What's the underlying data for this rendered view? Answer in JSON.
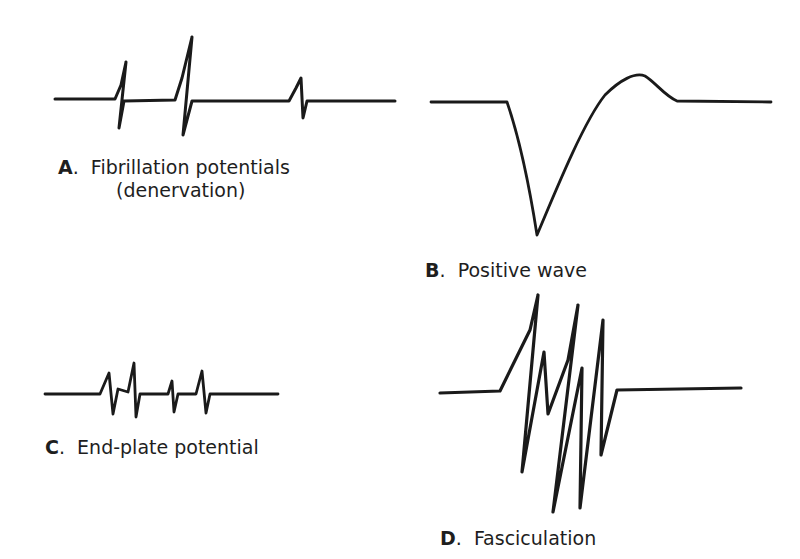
{
  "panels": [
    {
      "id": "A",
      "letter": "A",
      "title": "Fibrillation potentials",
      "subtitle": "(denervation)"
    },
    {
      "id": "B",
      "letter": "B",
      "title": "Positive wave"
    },
    {
      "id": "C",
      "letter": "C",
      "title": "End-plate potential"
    },
    {
      "id": "D",
      "letter": "D",
      "title": "Fasciculation"
    }
  ],
  "separator": ".",
  "colors": {
    "ink": "#1a1a1a",
    "background": "#ffffff"
  }
}
